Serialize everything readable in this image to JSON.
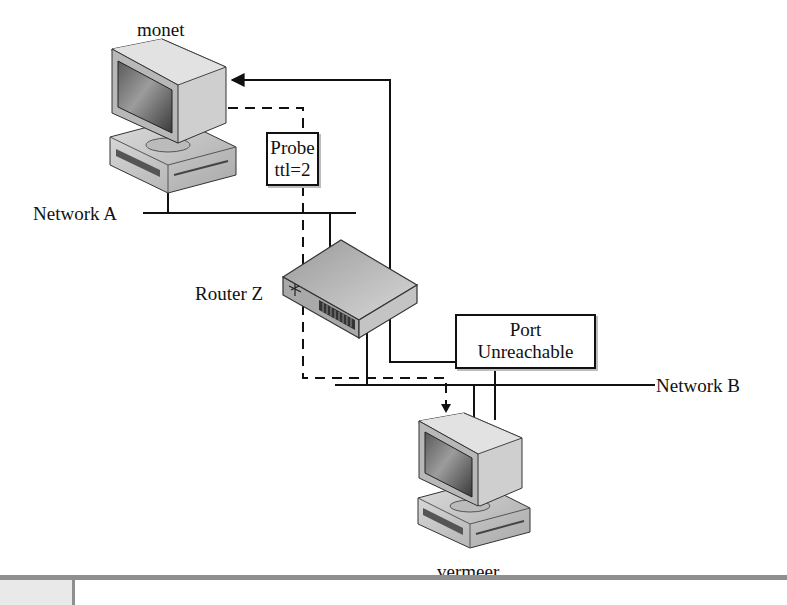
{
  "diagram": {
    "hosts": [
      {
        "id": "monet",
        "label": "monet",
        "type": "workstation"
      },
      {
        "id": "vermeer",
        "label": "vermeer",
        "type": "workstation"
      }
    ],
    "router": {
      "id": "router-z",
      "label": "Router Z",
      "icon": "router-icon"
    },
    "networks": [
      {
        "id": "network-a",
        "label": "Network A"
      },
      {
        "id": "network-b",
        "label": "Network B"
      }
    ],
    "messages": [
      {
        "id": "probe",
        "line1": "Probe",
        "line2": "ttl=2",
        "style": "dashed",
        "from": "monet",
        "to": "vermeer"
      },
      {
        "id": "port-unreachable",
        "line1": "Port",
        "line2": "Unreachable",
        "style": "solid",
        "from": "vermeer",
        "to": "monet"
      }
    ],
    "colors": {
      "line": "#111111",
      "footer_bar": "#8f8f8f",
      "background": "#ffffff"
    }
  }
}
